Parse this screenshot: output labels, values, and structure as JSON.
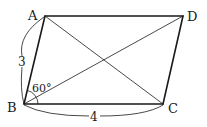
{
  "figure": {
    "type": "parallelogram",
    "vertices": {
      "A": {
        "label": "A",
        "x": 45,
        "y": 16
      },
      "B": {
        "label": "B",
        "x": 24,
        "y": 104
      },
      "C": {
        "label": "C",
        "x": 163,
        "y": 104
      },
      "D": {
        "label": "D",
        "x": 183,
        "y": 16
      }
    },
    "measurements": {
      "AB": "3",
      "BC": "4",
      "angle_ABC": "60°"
    },
    "diagonals": [
      "AC",
      "BD"
    ]
  }
}
